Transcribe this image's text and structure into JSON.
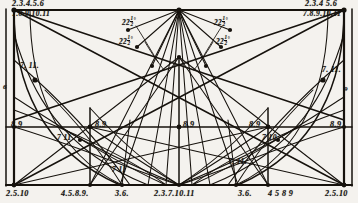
{
  "drawing": {
    "title": "Geometric construction: semicircular arch development with 22 1/2 degree divisions",
    "ink_color": "#16120d",
    "paper_color": "#f4f2ee",
    "width": 358,
    "height": 203
  },
  "angle_labels": [
    {
      "id": "angle-left-outer",
      "value": "22",
      "fraction_num": "1",
      "fraction_den": "2",
      "unit": "°",
      "x": 122,
      "y": 16
    },
    {
      "id": "angle-left-inner",
      "value": "22",
      "fraction_num": "1",
      "fraction_den": "2",
      "unit": "°",
      "x": 119,
      "y": 35
    },
    {
      "id": "angle-right-outer",
      "value": "22",
      "fraction_num": "1",
      "fraction_den": "2",
      "unit": "°",
      "x": 214,
      "y": 16
    },
    {
      "id": "angle-right-inner",
      "value": "22",
      "fraction_num": "1",
      "fraction_den": "2",
      "unit": "°",
      "x": 216,
      "y": 35
    }
  ],
  "corner_labels": [
    {
      "id": "top-left-upper",
      "text": "2.3.4.5.6",
      "x": 12,
      "y": 1
    },
    {
      "id": "top-left-lower",
      "text": "7.8.9.10.11",
      "x": 12,
      "y": 10
    },
    {
      "id": "top-right-upper",
      "text": "2.3.4 5.6",
      "x": 305,
      "y": 1
    },
    {
      "id": "top-right-lower",
      "text": "7.8.9.10.11",
      "x": 303,
      "y": 10
    }
  ],
  "mid_labels": [
    {
      "id": "mid-8-9-a",
      "text": "8.9",
      "x": 11,
      "y": 121
    },
    {
      "id": "mid-8-9-b",
      "text": "8.9",
      "x": 95,
      "y": 121
    },
    {
      "id": "mid-8-9-c",
      "text": "8.9",
      "x": 183,
      "y": 121
    },
    {
      "id": "mid-8-9-d",
      "text": "8.9",
      "x": 249,
      "y": 121
    },
    {
      "id": "mid-8-9-e",
      "text": "8.9",
      "x": 330,
      "y": 121
    }
  ],
  "node_labels": [
    {
      "id": "node-7-11-upper-left",
      "text": "7. 11.",
      "x": 20,
      "y": 62
    },
    {
      "id": "node-6-left",
      "text": "6",
      "x": 3,
      "y": 84
    },
    {
      "id": "node-7-11-upper-right",
      "text": "7. 11.",
      "x": 322,
      "y": 66
    },
    {
      "id": "node-9-right",
      "text": "9",
      "x": 344,
      "y": 86
    },
    {
      "id": "node-7-11-mid-left",
      "text": "7 11",
      "x": 57,
      "y": 134
    },
    {
      "id": "node-7-10-mid-right",
      "text": "7 10",
      "x": 262,
      "y": 134
    },
    {
      "id": "node-7-11-low-left",
      "text": "7 11",
      "x": 112,
      "y": 166
    },
    {
      "id": "node-7-11-low-right",
      "text": "7. 11.",
      "x": 130,
      "y": 160
    },
    {
      "id": "node-7-11-low-far",
      "text": "7. 11.",
      "x": 228,
      "y": 158
    }
  ],
  "bottom_labels": [
    {
      "id": "bottom-2-5-10-left",
      "text": "2.5.10",
      "x": 6,
      "y": 190
    },
    {
      "id": "bottom-4-5-8-9-left",
      "text": "4.5.8.9.",
      "x": 61,
      "y": 190
    },
    {
      "id": "bottom-3-6-left",
      "text": "3.6.",
      "x": 115,
      "y": 190
    },
    {
      "id": "bottom-center",
      "text": "2.3.7.10.11",
      "x": 154,
      "y": 190
    },
    {
      "id": "bottom-3-6-right",
      "text": "3.6.",
      "x": 238,
      "y": 190
    },
    {
      "id": "bottom-4-5-8-9-right",
      "text": "4 5 8 9",
      "x": 268,
      "y": 190
    },
    {
      "id": "bottom-2-5-10-right",
      "text": "2.5.10",
      "x": 325,
      "y": 190
    }
  ]
}
